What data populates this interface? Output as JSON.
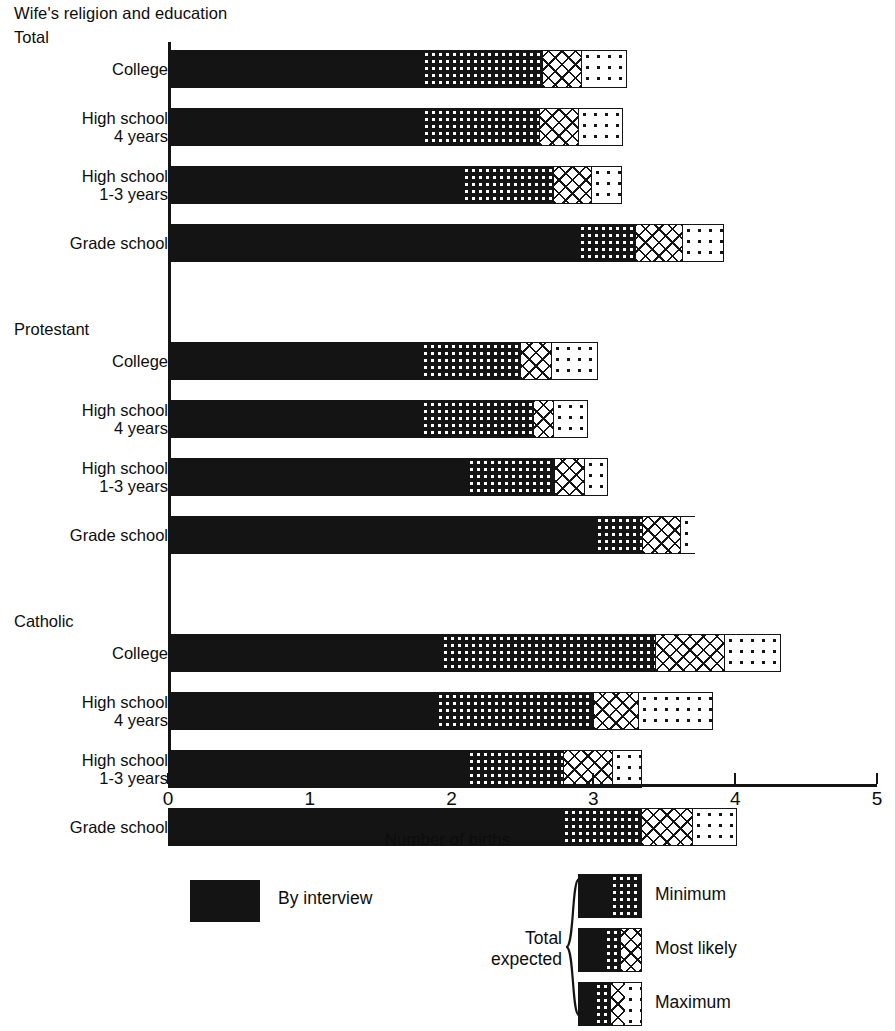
{
  "title": "Wife's religion and education",
  "axis": {
    "label": "Number of births",
    "ticks": [
      "0",
      "1",
      "2",
      "3",
      "4",
      "5"
    ],
    "min": 0,
    "max": 5
  },
  "legend": {
    "interview_label": "By interview",
    "total_expected_line1": "Total",
    "total_expected_line2": "expected",
    "items": [
      {
        "key": "minimum",
        "label": "Minimum"
      },
      {
        "key": "most_likely",
        "label": "Most likely"
      },
      {
        "key": "maximum",
        "label": "Maximum"
      }
    ]
  },
  "chart_data": {
    "type": "bar",
    "orientation": "horizontal",
    "stacked": true,
    "title": "Wife's religion and education",
    "xlabel": "Number of births",
    "ylabel": "",
    "xlim": [
      0,
      5
    ],
    "xticks": [
      0,
      1,
      2,
      3,
      4,
      5
    ],
    "grid": false,
    "legend_position": "bottom",
    "series": [
      {
        "name": "By interview",
        "pattern": "solid-black"
      },
      {
        "name": "Minimum",
        "pattern": "dense-dots-on-black"
      },
      {
        "name": "Most likely",
        "pattern": "crosshatch"
      },
      {
        "name": "Maximum",
        "pattern": "sparse-dots"
      }
    ],
    "groups": [
      {
        "name": "Total",
        "rows": [
          {
            "label_line1": "College",
            "label_line2": "",
            "by_interview": 1.8,
            "minimum": 2.64,
            "most_likely": 2.92,
            "maximum": 3.24
          },
          {
            "label_line1": "High school",
            "label_line2": "4 years",
            "by_interview": 1.8,
            "minimum": 2.62,
            "most_likely": 2.9,
            "maximum": 3.21
          },
          {
            "label_line1": "High school",
            "label_line2": "1-3 years",
            "by_interview": 2.08,
            "minimum": 2.72,
            "most_likely": 2.99,
            "maximum": 3.2
          },
          {
            "label_line1": "Grade school",
            "label_line2": "",
            "by_interview": 2.9,
            "minimum": 3.3,
            "most_likely": 3.63,
            "maximum": 3.92
          }
        ]
      },
      {
        "name": "Protestant",
        "rows": [
          {
            "label_line1": "College",
            "label_line2": "",
            "by_interview": 1.79,
            "minimum": 2.49,
            "most_likely": 2.71,
            "maximum": 3.03
          },
          {
            "label_line1": "High school",
            "label_line2": "4 years",
            "by_interview": 1.79,
            "minimum": 2.58,
            "most_likely": 2.72,
            "maximum": 2.96
          },
          {
            "label_line1": "High school",
            "label_line2": "1-3 years",
            "by_interview": 2.12,
            "minimum": 2.73,
            "most_likely": 2.94,
            "maximum": 3.1
          },
          {
            "label_line1": "Grade school",
            "label_line2": "",
            "by_interview": 3.02,
            "minimum": 3.35,
            "most_likely": 3.62,
            "maximum": 3.72
          }
        ]
      },
      {
        "name": "Catholic",
        "rows": [
          {
            "label_line1": "College",
            "label_line2": "",
            "by_interview": 1.93,
            "minimum": 3.44,
            "most_likely": 3.93,
            "maximum": 4.32
          },
          {
            "label_line1": "High school",
            "label_line2": "4 years",
            "by_interview": 1.9,
            "minimum": 3.0,
            "most_likely": 3.32,
            "maximum": 3.84
          },
          {
            "label_line1": "High school",
            "label_line2": "1-3 years",
            "by_interview": 2.12,
            "minimum": 2.79,
            "most_likely": 3.14,
            "maximum": 3.34
          },
          {
            "label_line1": "Grade school",
            "label_line2": "",
            "by_interview": 2.79,
            "minimum": 3.34,
            "most_likely": 3.7,
            "maximum": 4.01
          }
        ]
      }
    ]
  }
}
